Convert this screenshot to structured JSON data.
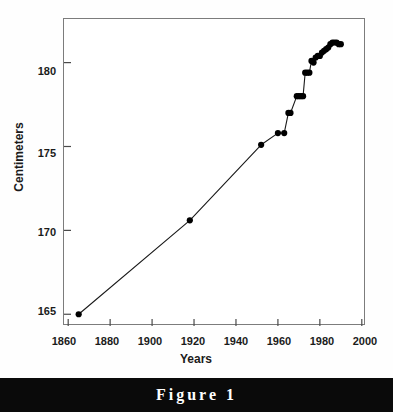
{
  "figure": {
    "caption": "Figure 1",
    "caption_bar_color": "#0a0a0a",
    "caption_text_color": "#ffffff"
  },
  "chart_data": {
    "type": "line",
    "title": "",
    "subtitle": "",
    "xlabel": "Years",
    "ylabel": "Centimeters",
    "xlim": [
      1858,
      2002
    ],
    "ylim": [
      164.3,
      182.6
    ],
    "xticks": [
      1860,
      1880,
      1900,
      1920,
      1940,
      1960,
      1980,
      2000
    ],
    "xticklabels": [
      "1860",
      "1880",
      "1900",
      "1920",
      "1940",
      "1960",
      "1980",
      "2000"
    ],
    "yticks": [
      165,
      170,
      175,
      180
    ],
    "yticklabels": [
      "165",
      "170",
      "175",
      "180"
    ],
    "grid": false,
    "legend": null,
    "marker": "filled-circle",
    "marker_color": "#000000",
    "line_color": "#1a1a1a",
    "series": [
      {
        "name": "Mean height",
        "x": [
          1865,
          1918,
          1952,
          1960,
          1963,
          1965,
          1966,
          1969,
          1970,
          1971,
          1972,
          1973,
          1974,
          1975,
          1976,
          1977,
          1978,
          1979,
          1980,
          1981,
          1982,
          1983,
          1984,
          1985,
          1986,
          1987,
          1988,
          1989,
          1990
        ],
        "y": [
          165.0,
          170.6,
          175.1,
          175.8,
          175.8,
          177.0,
          177.0,
          178.0,
          178.0,
          178.0,
          178.0,
          179.4,
          179.4,
          179.4,
          180.1,
          180.0,
          180.3,
          180.4,
          180.4,
          180.6,
          180.7,
          180.8,
          180.9,
          181.1,
          181.2,
          181.2,
          181.2,
          181.1,
          181.1
        ]
      }
    ]
  }
}
